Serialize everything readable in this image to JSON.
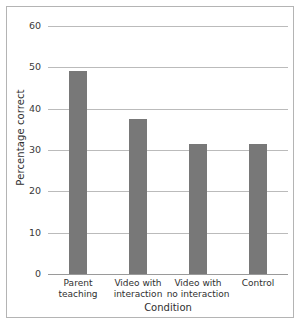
{
  "chart_data": {
    "type": "bar",
    "title": "",
    "xlabel": "Condition",
    "ylabel": "Percentage correct",
    "categories": [
      "Parent teaching",
      "Video with interaction",
      "Video with no interaction",
      "Control"
    ],
    "category_lines": [
      [
        "Parent",
        "teaching"
      ],
      [
        "Video with",
        "interaction"
      ],
      [
        "Video with",
        "no interaction"
      ],
      [
        "Control",
        ""
      ]
    ],
    "values": [
      49.2,
      37.6,
      31.4,
      31.4
    ],
    "ylim": [
      0,
      60
    ],
    "yticks": [
      0,
      10,
      20,
      30,
      40,
      50,
      60
    ],
    "ytick_labels": [
      "0",
      "10",
      "20",
      "30",
      "40",
      "50",
      "60"
    ],
    "grid": true,
    "legend": false,
    "bar_color": "#787878",
    "gridline_color": "#bbbbbb",
    "frame_color": "#b4b4b4",
    "background": "#ffffff"
  }
}
